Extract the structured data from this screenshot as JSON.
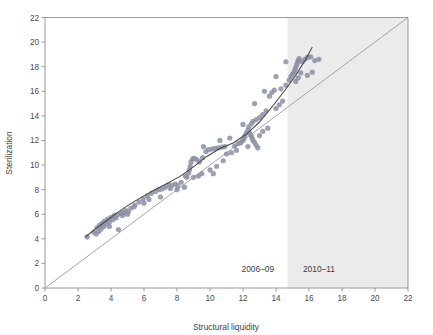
{
  "chart_data": {
    "type": "scatter",
    "title": "",
    "xlabel": "Structural liquidity",
    "ylabel": "Sterilization",
    "xlim": [
      0,
      22
    ],
    "ylim": [
      0,
      22
    ],
    "xticks": [
      0,
      2,
      4,
      6,
      8,
      10,
      12,
      14,
      16,
      18,
      20,
      22
    ],
    "yticks": [
      0,
      2,
      4,
      6,
      8,
      10,
      12,
      14,
      16,
      18,
      20,
      22
    ],
    "grid": false,
    "legend": "none",
    "point_color": "#8b8fa3",
    "fit_line_color": "#4a4a4a",
    "diagonal_line_color": "#9a9a9a",
    "shaded_band_color": "#ebebeb",
    "shaded_band_x_start": 14.7,
    "shaded_band_x_end": 22,
    "annotations": [
      {
        "text": "2006–09",
        "x": 12.9,
        "y": 1.3
      },
      {
        "text": "2010–11",
        "x": 16.6,
        "y": 1.3
      }
    ],
    "reference_line_45deg": {
      "from": [
        0,
        0
      ],
      "to": [
        22,
        22
      ]
    },
    "fit_line_points": [
      [
        2.45,
        4.15
      ],
      [
        3.0,
        4.75
      ],
      [
        3.6,
        5.35
      ],
      [
        4.3,
        6.05
      ],
      [
        5.0,
        6.7
      ],
      [
        5.8,
        7.35
      ],
      [
        6.6,
        7.95
      ],
      [
        7.4,
        8.5
      ],
      [
        8.2,
        9.1
      ],
      [
        9.0,
        9.85
      ],
      [
        9.8,
        10.7
      ],
      [
        10.6,
        11.35
      ],
      [
        11.4,
        11.8
      ],
      [
        12.2,
        12.5
      ],
      [
        13.0,
        13.5
      ],
      [
        13.8,
        14.8
      ],
      [
        14.5,
        16.0
      ],
      [
        15.2,
        17.3
      ],
      [
        15.8,
        18.6
      ],
      [
        16.2,
        19.6
      ]
    ],
    "points": [
      [
        2.55,
        4.15
      ],
      [
        2.95,
        4.55
      ],
      [
        3.15,
        4.9
      ],
      [
        3.25,
        4.6
      ],
      [
        3.3,
        5.1
      ],
      [
        3.4,
        4.8
      ],
      [
        3.45,
        5.25
      ],
      [
        3.55,
        5.0
      ],
      [
        3.6,
        5.45
      ],
      [
        3.7,
        5.2
      ],
      [
        3.8,
        5.6
      ],
      [
        3.9,
        5.35
      ],
      [
        4.0,
        5.75
      ],
      [
        4.1,
        5.55
      ],
      [
        4.2,
        5.9
      ],
      [
        4.3,
        5.7
      ],
      [
        4.4,
        5.95
      ],
      [
        4.45,
        4.75
      ],
      [
        4.6,
        6.05
      ],
      [
        4.75,
        6.15
      ],
      [
        4.9,
        6.3
      ],
      [
        5.05,
        6.2
      ],
      [
        5.2,
        6.5
      ],
      [
        5.45,
        6.75
      ],
      [
        5.7,
        7.0
      ],
      [
        5.95,
        7.25
      ],
      [
        6.2,
        7.5
      ],
      [
        6.45,
        7.7
      ],
      [
        6.7,
        7.85
      ],
      [
        6.9,
        8.0
      ],
      [
        7.1,
        8.05
      ],
      [
        7.3,
        8.2
      ],
      [
        7.5,
        8.4
      ],
      [
        7.7,
        8.35
      ],
      [
        7.9,
        8.45
      ],
      [
        8.05,
        8.3
      ],
      [
        8.25,
        8.6
      ],
      [
        8.45,
        8.2
      ],
      [
        8.6,
        9.0
      ],
      [
        8.7,
        9.35
      ],
      [
        8.75,
        9.6
      ],
      [
        8.8,
        9.9
      ],
      [
        8.85,
        10.25
      ],
      [
        8.95,
        10.5
      ],
      [
        9.05,
        10.55
      ],
      [
        9.2,
        10.45
      ],
      [
        9.35,
        10.25
      ],
      [
        9.55,
        10.6
      ],
      [
        9.75,
        11.1
      ],
      [
        9.9,
        11.25
      ],
      [
        10.1,
        11.3
      ],
      [
        10.3,
        11.35
      ],
      [
        10.5,
        11.4
      ],
      [
        10.7,
        11.45
      ],
      [
        10.9,
        11.5
      ],
      [
        9.0,
        9.0
      ],
      [
        9.5,
        9.3
      ],
      [
        10.0,
        9.6
      ],
      [
        10.4,
        9.9
      ],
      [
        10.8,
        10.35
      ],
      [
        11.3,
        11.0
      ],
      [
        11.5,
        11.55
      ],
      [
        11.7,
        11.75
      ],
      [
        11.85,
        11.8
      ],
      [
        11.95,
        11.95
      ],
      [
        12.05,
        12.1
      ],
      [
        12.1,
        12.35
      ],
      [
        12.2,
        12.6
      ],
      [
        12.3,
        12.85
      ],
      [
        12.4,
        12.6
      ],
      [
        12.5,
        12.4
      ],
      [
        12.55,
        12.2
      ],
      [
        12.6,
        12.0
      ],
      [
        12.7,
        11.85
      ],
      [
        12.8,
        11.6
      ],
      [
        12.9,
        11.4
      ],
      [
        12.35,
        13.1
      ],
      [
        12.5,
        13.35
      ],
      [
        12.6,
        13.55
      ],
      [
        12.8,
        13.7
      ],
      [
        13.0,
        13.85
      ],
      [
        13.2,
        14.1
      ],
      [
        13.4,
        14.4
      ],
      [
        13.0,
        12.4
      ],
      [
        13.2,
        12.75
      ],
      [
        13.5,
        13.0
      ],
      [
        13.6,
        15.6
      ],
      [
        13.75,
        15.9
      ],
      [
        13.9,
        16.1
      ],
      [
        14.0,
        14.6
      ],
      [
        14.2,
        14.9
      ],
      [
        14.4,
        15.2
      ],
      [
        14.6,
        16.5
      ],
      [
        14.8,
        16.9
      ],
      [
        14.9,
        17.2
      ],
      [
        15.0,
        17.4
      ],
      [
        15.1,
        17.55
      ],
      [
        15.15,
        17.75
      ],
      [
        15.2,
        17.95
      ],
      [
        15.25,
        18.15
      ],
      [
        15.3,
        18.35
      ],
      [
        15.35,
        18.5
      ],
      [
        15.4,
        18.65
      ],
      [
        15.2,
        16.8
      ],
      [
        15.35,
        17.1
      ],
      [
        15.5,
        17.5
      ],
      [
        15.6,
        18.4
      ],
      [
        15.75,
        18.6
      ],
      [
        15.9,
        18.75
      ],
      [
        16.1,
        18.8
      ],
      [
        16.35,
        18.5
      ],
      [
        16.6,
        18.6
      ],
      [
        15.9,
        17.3
      ],
      [
        16.2,
        17.55
      ],
      [
        14.6,
        18.4
      ],
      [
        14.0,
        17.2
      ],
      [
        13.3,
        16.0
      ],
      [
        12.7,
        15.0
      ],
      [
        12.0,
        13.3
      ],
      [
        11.2,
        12.2
      ],
      [
        10.6,
        12.0
      ],
      [
        9.6,
        11.5
      ],
      [
        8.5,
        9.1
      ],
      [
        7.6,
        8.1
      ],
      [
        6.3,
        7.2
      ],
      [
        5.4,
        6.6
      ],
      [
        4.7,
        5.9
      ],
      [
        3.9,
        5.0
      ],
      [
        3.1,
        4.4
      ],
      [
        6.0,
        6.9
      ],
      [
        7.0,
        7.4
      ],
      [
        8.0,
        8.0
      ],
      [
        5.0,
        6.0
      ],
      [
        11.0,
        10.9
      ],
      [
        11.6,
        11.2
      ],
      [
        12.3,
        11.5
      ],
      [
        9.3,
        9.1
      ],
      [
        10.2,
        9.3
      ],
      [
        14.3,
        16.2
      ]
    ]
  }
}
